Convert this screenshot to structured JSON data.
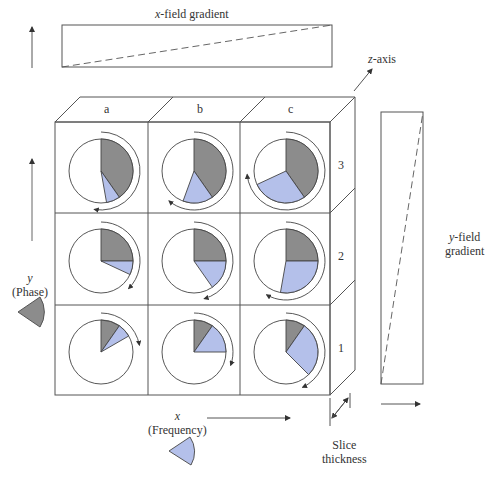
{
  "title_x_gradient": {
    "var": "x",
    "rest": "-field gradient"
  },
  "title_y_gradient": {
    "var": "y",
    "rest": "-field",
    "line2": "gradient"
  },
  "z_axis": {
    "var": "z",
    "rest": "-axis"
  },
  "y_axis": {
    "var": "y",
    "label": "(Phase)"
  },
  "x_axis": {
    "var": "x",
    "label": "(Frequency)"
  },
  "slice": {
    "line1": "Slice",
    "line2": "thickness"
  },
  "columns": [
    "a",
    "b",
    "c"
  ],
  "rows": [
    "3",
    "2",
    "1"
  ],
  "colors": {
    "phase_gray": "#8c8c8c",
    "freq_blue": "#b4c0ea",
    "line": "#444444"
  },
  "voxels": [
    {
      "row": "3",
      "col": "a",
      "gray_deg": 145,
      "blue_deg": 25
    },
    {
      "row": "3",
      "col": "b",
      "gray_deg": 145,
      "blue_deg": 55
    },
    {
      "row": "3",
      "col": "c",
      "gray_deg": 145,
      "blue_deg": 100
    },
    {
      "row": "2",
      "col": "a",
      "gray_deg": 90,
      "blue_deg": 25
    },
    {
      "row": "2",
      "col": "b",
      "gray_deg": 90,
      "blue_deg": 55
    },
    {
      "row": "2",
      "col": "c",
      "gray_deg": 90,
      "blue_deg": 100
    },
    {
      "row": "1",
      "col": "a",
      "gray_deg": 35,
      "blue_deg": 25
    },
    {
      "row": "1",
      "col": "b",
      "gray_deg": 35,
      "blue_deg": 55
    },
    {
      "row": "1",
      "col": "c",
      "gray_deg": 35,
      "blue_deg": 100
    }
  ]
}
